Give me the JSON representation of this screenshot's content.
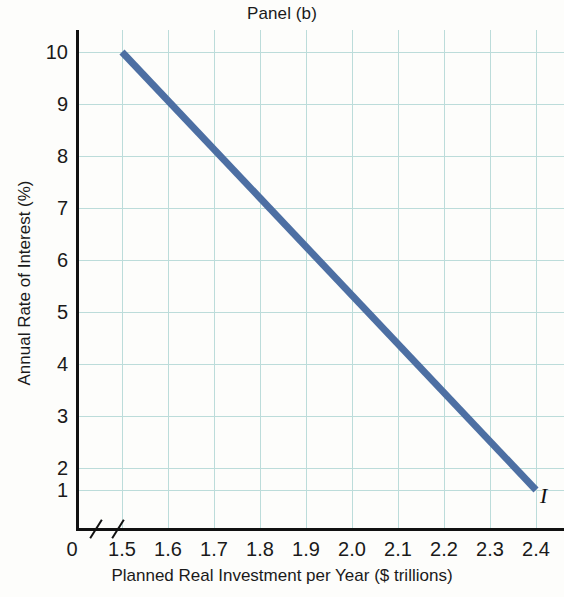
{
  "chart_data": {
    "type": "line",
    "title": "Panel (b)",
    "xlabel": "Planned Real Investment per Year ($ trillions)",
    "ylabel": "Annual Rate of Interest (%)",
    "xlim": [
      1.5,
      2.4
    ],
    "ylim": [
      1,
      10
    ],
    "grid": true,
    "legend": "none",
    "x_tick_labels": [
      "1.5",
      "1.6",
      "1.7",
      "1.8",
      "1.9",
      "2.0",
      "2.1",
      "2.2",
      "2.3",
      "2.4"
    ],
    "x_tick_values": [
      1.5,
      1.6,
      1.7,
      1.8,
      1.9,
      2.0,
      2.1,
      2.2,
      2.3,
      2.4
    ],
    "x_origin_label": "0",
    "y_tick_labels": [
      "10",
      "9",
      "8",
      "7",
      "6",
      "5",
      "4",
      "3",
      "2",
      "1"
    ],
    "y_tick_values": [
      10,
      9,
      8,
      7,
      6,
      5,
      4,
      3,
      2,
      1
    ],
    "axis_break": true,
    "series": [
      {
        "name": "I",
        "annotation": "I",
        "color": "#4d6fa3",
        "linewidth": 7,
        "x": [
          1.5,
          1.6,
          1.7,
          1.8,
          1.9,
          2.0,
          2.1,
          2.2,
          2.3,
          2.4
        ],
        "values": [
          10,
          9,
          8,
          7,
          6,
          5,
          4,
          3,
          2,
          1
        ]
      }
    ],
    "colors": {
      "line": "#4d6fa3",
      "grid": "#bcdcda",
      "axis": "#111111",
      "text": "#1a1a1a",
      "background": "#fdfdfb"
    }
  }
}
